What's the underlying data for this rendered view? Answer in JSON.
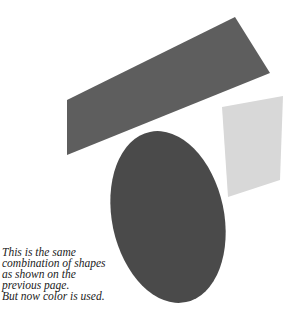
{
  "figure": {
    "shapes": [
      {
        "name": "parallelogram",
        "color": "#5e5e5e"
      },
      {
        "name": "light-quad",
        "color": "#d8d8d8"
      },
      {
        "name": "oval",
        "color": "#4a4a4a"
      }
    ]
  },
  "caption": {
    "lines": [
      "This is the same",
      "combination of shapes",
      "as shown on the",
      "previous page.",
      "But now color is used."
    ]
  }
}
